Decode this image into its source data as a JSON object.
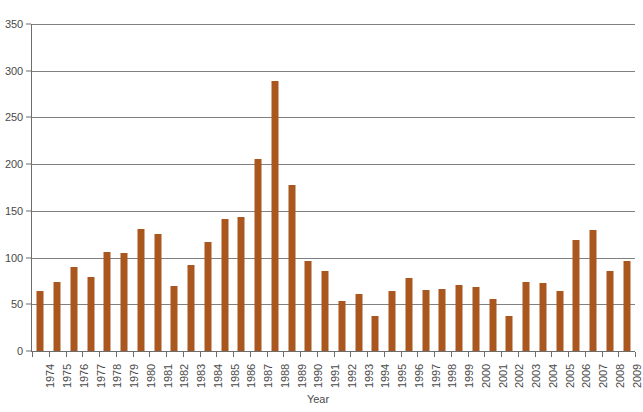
{
  "chart_data": {
    "type": "bar",
    "title": "",
    "subtitle": "",
    "xlabel": "Year",
    "ylabel": "",
    "grid": true,
    "legend": false,
    "bar_color": "#A9561F",
    "axis_color": "#6d6d6d",
    "gridline_color": "#808080",
    "ylim": [
      0,
      350
    ],
    "ytick_step": 50,
    "ytick_labels": [
      "0",
      "50",
      "100",
      "150",
      "200",
      "250",
      "300",
      "350"
    ],
    "ytick_values": [
      0,
      50,
      100,
      150,
      200,
      250,
      300,
      350
    ],
    "categories": [
      "1974",
      "1975",
      "1976",
      "1977",
      "1978",
      "1979",
      "1980",
      "1981",
      "1982",
      "1983",
      "1984",
      "1985",
      "1986",
      "1987",
      "1988",
      "1989",
      "1990",
      "1991",
      "1992",
      "1993",
      "1994",
      "1995",
      "1996",
      "1997",
      "1998",
      "1999",
      "2000",
      "2001",
      "2002",
      "2003",
      "2004",
      "2005",
      "2006",
      "2007",
      "2008",
      "2009"
    ],
    "values": [
      64,
      74,
      90,
      79,
      106,
      105,
      131,
      125,
      70,
      92,
      117,
      141,
      143,
      205,
      289,
      178,
      96,
      86,
      54,
      61,
      37,
      64,
      78,
      65,
      66,
      71,
      69,
      56,
      37,
      74,
      73,
      64,
      119,
      130,
      86,
      96
    ]
  }
}
